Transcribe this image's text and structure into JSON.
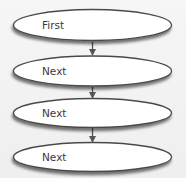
{
  "diagram": {
    "type": "flowchart",
    "direction": "top-to-bottom",
    "colors": {
      "background": "#f3f3f3",
      "node_fill": "#ffffff",
      "node_stroke": "#4a4a4a",
      "arrow": "#555555",
      "text": "#3a3a3a"
    },
    "nodes": [
      {
        "id": "n1",
        "shape": "ellipse",
        "label": "First"
      },
      {
        "id": "n2",
        "shape": "ellipse",
        "label": "Next"
      },
      {
        "id": "n3",
        "shape": "ellipse",
        "label": "Next"
      },
      {
        "id": "n4",
        "shape": "ellipse",
        "label": "Next"
      }
    ],
    "edges": [
      {
        "from": "n1",
        "to": "n2"
      },
      {
        "from": "n2",
        "to": "n3"
      },
      {
        "from": "n3",
        "to": "n4"
      }
    ]
  }
}
